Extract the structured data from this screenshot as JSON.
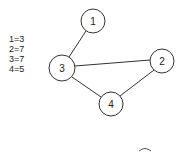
{
  "legend": {
    "entries": [
      "1=3",
      "2=7",
      "3=7",
      "4=5"
    ]
  },
  "graph": {
    "nodes": [
      {
        "id": "1",
        "label": "1",
        "x": 93,
        "y": 21,
        "r": 12
      },
      {
        "id": "2",
        "label": "2",
        "x": 162,
        "y": 61,
        "r": 12
      },
      {
        "id": "3",
        "label": "3",
        "x": 62,
        "y": 68,
        "r": 13
      },
      {
        "id": "4",
        "label": "4",
        "x": 111,
        "y": 104,
        "r": 12
      }
    ],
    "edges": [
      {
        "from": "1",
        "to": "3"
      },
      {
        "from": "3",
        "to": "2"
      },
      {
        "from": "3",
        "to": "4"
      },
      {
        "from": "2",
        "to": "4"
      }
    ],
    "stroke_color": "#333333"
  }
}
